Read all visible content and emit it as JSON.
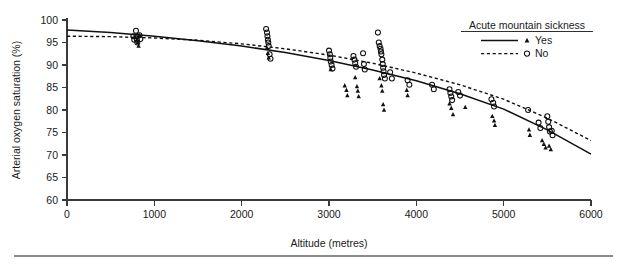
{
  "chart_data": {
    "type": "scatter",
    "title": "",
    "xlabel": "Altitude (metres)",
    "ylabel": "Arterial oxygen saturation (%)",
    "xlim": [
      0,
      6000
    ],
    "ylim": [
      60,
      100
    ],
    "xticks": [
      0,
      1000,
      2000,
      3000,
      4000,
      5000,
      6000
    ],
    "yticks": [
      60,
      65,
      70,
      75,
      80,
      85,
      90,
      95,
      100
    ],
    "grid": false,
    "legend": {
      "title": "Acute mountain sickness",
      "position": "top-right",
      "entries": [
        {
          "label": "Yes",
          "marker": "filled-triangle",
          "line": "solid"
        },
        {
          "label": "No",
          "marker": "open-circle",
          "line": "dotted"
        }
      ]
    },
    "series": [
      {
        "name": "Yes",
        "marker": "filled-triangle",
        "line": "solid",
        "fit_line": {
          "style": "solid",
          "points": [
            [
              0,
              97.8
            ],
            [
              500,
              97.2
            ],
            [
              1000,
              96.4
            ],
            [
              1500,
              95.4
            ],
            [
              2000,
              94.2
            ],
            [
              2500,
              92.8
            ],
            [
              3000,
              91.0
            ],
            [
              3500,
              88.9
            ],
            [
              4000,
              86.5
            ],
            [
              4500,
              83.6
            ],
            [
              5000,
              80.2
            ],
            [
              5500,
              75.6
            ],
            [
              6000,
              70.2
            ]
          ]
        },
        "points": [
          [
            780,
            96.2
          ],
          [
            800,
            95.6
          ],
          [
            810,
            95.0
          ],
          [
            820,
            94.2
          ],
          [
            830,
            96.6
          ],
          [
            2290,
            93.8
          ],
          [
            2300,
            92.6
          ],
          [
            2310,
            91.6
          ],
          [
            3020,
            89.0
          ],
          [
            3180,
            85.4
          ],
          [
            3200,
            84.4
          ],
          [
            3210,
            83.2
          ],
          [
            3300,
            87.2
          ],
          [
            3320,
            85.2
          ],
          [
            3330,
            84.2
          ],
          [
            3340,
            83.0
          ],
          [
            3580,
            87.0
          ],
          [
            3600,
            85.4
          ],
          [
            3610,
            84.2
          ],
          [
            3620,
            81.2
          ],
          [
            3630,
            80.0
          ],
          [
            3890,
            84.4
          ],
          [
            3900,
            83.2
          ],
          [
            4380,
            81.4
          ],
          [
            4400,
            80.4
          ],
          [
            4420,
            79.0
          ],
          [
            4560,
            80.6
          ],
          [
            4870,
            78.6
          ],
          [
            4890,
            77.6
          ],
          [
            4900,
            76.6
          ],
          [
            5290,
            75.6
          ],
          [
            5300,
            74.4
          ],
          [
            5440,
            73.2
          ],
          [
            5460,
            72.4
          ],
          [
            5480,
            71.6
          ],
          [
            5520,
            72.0
          ],
          [
            5540,
            71.2
          ]
        ]
      },
      {
        "name": "No",
        "marker": "open-circle",
        "line": "dotted",
        "fit_line": {
          "style": "dotted",
          "points": [
            [
              0,
              96.4
            ],
            [
              500,
              96.3
            ],
            [
              1000,
              96.0
            ],
            [
              1500,
              95.5
            ],
            [
              2000,
              94.7
            ],
            [
              2500,
              93.6
            ],
            [
              3000,
              92.2
            ],
            [
              3500,
              90.4
            ],
            [
              4000,
              88.2
            ],
            [
              4500,
              85.6
            ],
            [
              5000,
              82.4
            ],
            [
              5500,
              78.2
            ],
            [
              6000,
              73.2
            ]
          ]
        },
        "points": [
          [
            760,
            96.4
          ],
          [
            770,
            95.6
          ],
          [
            790,
            97.6
          ],
          [
            795,
            96.4
          ],
          [
            800,
            95.6
          ],
          [
            805,
            95.0
          ],
          [
            830,
            96.6
          ],
          [
            840,
            95.8
          ],
          [
            2280,
            98.0
          ],
          [
            2290,
            97.2
          ],
          [
            2295,
            96.4
          ],
          [
            2300,
            95.6
          ],
          [
            2305,
            95.0
          ],
          [
            2310,
            94.2
          ],
          [
            2320,
            92.4
          ],
          [
            2330,
            91.4
          ],
          [
            3000,
            93.2
          ],
          [
            3010,
            92.4
          ],
          [
            3015,
            91.6
          ],
          [
            3020,
            90.8
          ],
          [
            3030,
            90.0
          ],
          [
            3040,
            89.2
          ],
          [
            3280,
            92.0
          ],
          [
            3290,
            91.2
          ],
          [
            3300,
            90.4
          ],
          [
            3310,
            89.6
          ],
          [
            3390,
            92.6
          ],
          [
            3400,
            90.2
          ],
          [
            3410,
            89.0
          ],
          [
            3560,
            97.2
          ],
          [
            3570,
            95.0
          ],
          [
            3580,
            94.2
          ],
          [
            3590,
            93.6
          ],
          [
            3595,
            93.0
          ],
          [
            3600,
            92.4
          ],
          [
            3610,
            91.2
          ],
          [
            3615,
            90.2
          ],
          [
            3620,
            89.4
          ],
          [
            3625,
            88.6
          ],
          [
            3630,
            87.8
          ],
          [
            3640,
            87.0
          ],
          [
            3700,
            88.4
          ],
          [
            3720,
            87.0
          ],
          [
            3900,
            86.6
          ],
          [
            3920,
            85.6
          ],
          [
            4180,
            85.6
          ],
          [
            4200,
            84.6
          ],
          [
            4380,
            84.6
          ],
          [
            4390,
            83.8
          ],
          [
            4400,
            83.0
          ],
          [
            4410,
            82.2
          ],
          [
            4480,
            84.0
          ],
          [
            4500,
            83.2
          ],
          [
            4860,
            82.4
          ],
          [
            4880,
            81.6
          ],
          [
            4890,
            80.8
          ],
          [
            5280,
            80.0
          ],
          [
            5400,
            77.2
          ],
          [
            5420,
            76.0
          ],
          [
            5500,
            78.6
          ],
          [
            5510,
            77.4
          ],
          [
            5520,
            76.2
          ],
          [
            5530,
            75.2
          ],
          [
            5550,
            75.4
          ],
          [
            5560,
            74.4
          ]
        ]
      }
    ]
  },
  "figure": {
    "footer_rule_visible": true
  }
}
